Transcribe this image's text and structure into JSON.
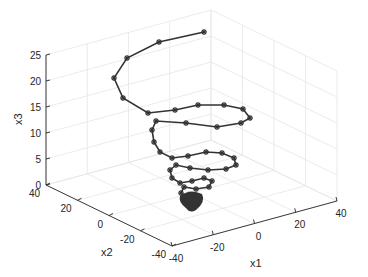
{
  "chart_data": {
    "type": "line3d",
    "title": "",
    "xlabel": "x1",
    "ylabel": "x2",
    "zlabel": "x3",
    "xlim": [
      -40,
      40
    ],
    "ylim": [
      -40,
      40
    ],
    "zlim": [
      0,
      25
    ],
    "x_ticks": [
      "-40",
      "-20",
      "0",
      "20",
      "40"
    ],
    "y_ticks": [
      "-40",
      "-20",
      "0",
      "20",
      "40"
    ],
    "z_ticks": [
      "0",
      "5",
      "10",
      "15",
      "20",
      "25"
    ],
    "grid": true,
    "marker": "asterisk",
    "line_color": "#333333",
    "series": [
      {
        "name": "trajectory",
        "screen_points": [
          [
            204,
            32
          ],
          [
            159,
            42
          ],
          [
            127,
            58
          ],
          [
            114,
            78
          ],
          [
            123,
            98
          ],
          [
            148,
            113
          ],
          [
            175,
            110
          ],
          [
            198,
            105
          ],
          [
            224,
            105
          ],
          [
            243,
            109
          ],
          [
            250,
            118
          ],
          [
            241,
            123
          ],
          [
            217,
            127
          ],
          [
            186,
            123
          ],
          [
            156,
            121
          ],
          [
            152,
            130
          ],
          [
            154,
            142
          ],
          [
            160,
            152
          ],
          [
            172,
            158
          ],
          [
            188,
            156
          ],
          [
            206,
            152
          ],
          [
            222,
            153
          ],
          [
            234,
            158
          ],
          [
            236,
            165
          ],
          [
            226,
            169
          ],
          [
            208,
            170
          ],
          [
            190,
            168
          ],
          [
            176,
            165
          ],
          [
            170,
            170
          ],
          [
            172,
            178
          ],
          [
            180,
            183
          ],
          [
            192,
            181
          ],
          [
            204,
            178
          ],
          [
            212,
            181
          ],
          [
            209,
            187
          ],
          [
            196,
            189
          ],
          [
            184,
            187
          ],
          [
            181,
            193
          ],
          [
            186,
            197
          ],
          [
            194,
            196
          ],
          [
            200,
            198
          ],
          [
            195,
            202
          ],
          [
            188,
            201
          ],
          [
            187,
            205
          ],
          [
            191,
            204
          ],
          [
            190,
            207
          ]
        ]
      }
    ]
  }
}
